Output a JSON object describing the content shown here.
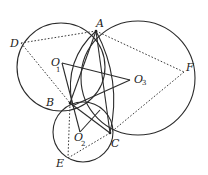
{
  "diagram": {
    "type": "geometry",
    "points": {
      "A": {
        "label": "A",
        "x": 96,
        "y": 31
      },
      "B": {
        "label": "B",
        "x": 70,
        "y": 103
      },
      "C": {
        "label": "C",
        "x": 110,
        "y": 133
      },
      "D": {
        "label": "D",
        "x": 21,
        "y": 43
      },
      "E": {
        "label": "E",
        "x": 68,
        "y": 158
      },
      "F": {
        "label": "F",
        "x": 184,
        "y": 72
      },
      "O1": {
        "label": "O",
        "sub": "1",
        "x": 62,
        "y": 63
      },
      "O2": {
        "label": "O",
        "sub": "2",
        "x": 80,
        "y": 134
      },
      "O3": {
        "label": "O",
        "sub": "3",
        "x": 130,
        "y": 80
      }
    },
    "circles": [
      {
        "name": "circle-O1",
        "cx": 61,
        "cy": 67,
        "r": 44
      },
      {
        "name": "circle-O3",
        "cx": 138,
        "cy": 78,
        "r": 57
      },
      {
        "name": "circle-O2",
        "cx": 83,
        "cy": 132,
        "r": 30
      }
    ],
    "solid_segments": [
      [
        "A",
        "B"
      ],
      [
        "A",
        "C"
      ],
      [
        "O1",
        "O3"
      ],
      [
        "O3",
        "B"
      ],
      [
        "O1",
        "O2"
      ],
      [
        "B",
        "C"
      ]
    ],
    "dashed_segments": [
      [
        "D",
        "A"
      ],
      [
        "A",
        "F"
      ],
      [
        "D",
        "B"
      ],
      [
        "F",
        "C"
      ],
      [
        "B",
        "E"
      ],
      [
        "E",
        "C"
      ]
    ],
    "arcs": [
      {
        "name": "arc-AB-lens",
        "from": "A",
        "to": "B"
      },
      {
        "name": "arc-AC-lens",
        "from": "A",
        "to": "C"
      }
    ]
  }
}
